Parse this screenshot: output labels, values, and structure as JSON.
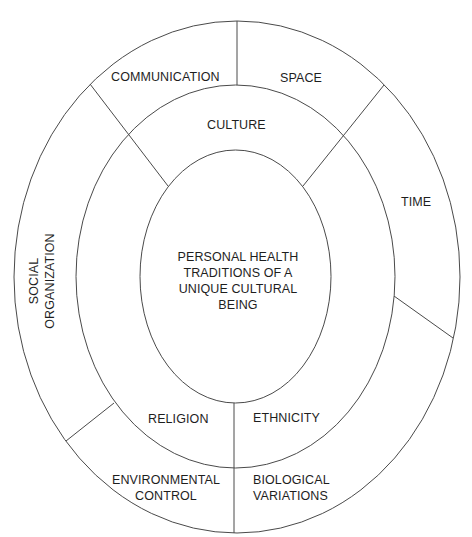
{
  "diagram": {
    "center": {
      "lines": [
        "PERSONAL HEALTH",
        "TRADITIONS OF A",
        "UNIQUE CULTURAL",
        "BEING"
      ]
    },
    "middle_ring": {
      "top": "CULTURE",
      "bottom_left": "RELIGION",
      "bottom_right": "ETHNICITY"
    },
    "outer_ring": {
      "communication": "COMMUNICATION",
      "space": "SPACE",
      "time": "TIME",
      "social_organization": [
        "SOCIAL",
        "ORGANIZATION"
      ],
      "environmental_control": [
        "ENVIRONMENTAL",
        "CONTROL"
      ],
      "biological_variations": [
        "BIOLOGICAL",
        "VARIATIONS"
      ]
    },
    "colors": {
      "stroke": "#4a4a4a",
      "text": "#1e1e1e",
      "background": "#ffffff"
    }
  }
}
